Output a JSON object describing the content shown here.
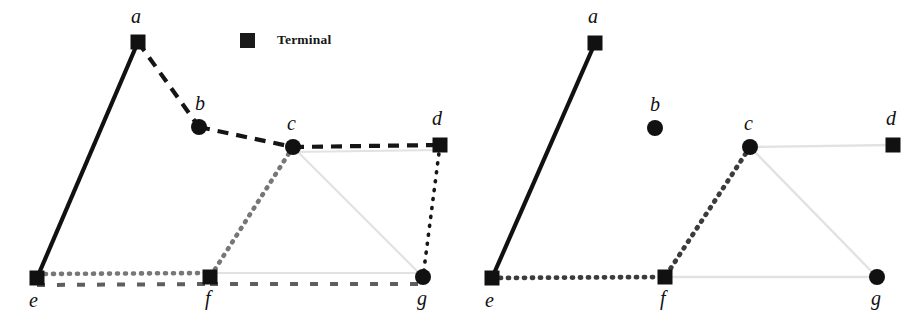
{
  "figure": {
    "width": 924,
    "height": 332,
    "background": "#ffffff"
  },
  "legend": {
    "swatch_icon": "filled-square-marker",
    "swatch_color": "#1a1a1a",
    "label": "Terminal"
  },
  "style": {
    "node_fill": "#111111",
    "square_size": 15,
    "circle_radius": 8,
    "edge_colors": {
      "black": "#111111",
      "dark_gray": "#4a4a4a",
      "mid_gray": "#6f6f6f",
      "light_gray": "#e2e2e2"
    }
  },
  "panels": [
    {
      "id": "left",
      "name": "left-panel",
      "nodes": [
        {
          "id": "a",
          "label": "a",
          "shape": "square",
          "x": 138,
          "y": 42,
          "label_x": 131,
          "label_y": 6,
          "terminal": true
        },
        {
          "id": "b",
          "label": "b",
          "shape": "circle",
          "x": 199,
          "y": 127,
          "label_x": 195,
          "label_y": 93,
          "terminal": false
        },
        {
          "id": "c",
          "label": "c",
          "shape": "circle",
          "x": 293,
          "y": 147,
          "label_x": 287,
          "label_y": 113,
          "terminal": false
        },
        {
          "id": "d",
          "label": "d",
          "shape": "square",
          "x": 440,
          "y": 145,
          "label_x": 432,
          "label_y": 108,
          "terminal": true
        },
        {
          "id": "e",
          "label": "e",
          "shape": "square",
          "x": 37,
          "y": 278,
          "label_x": 29,
          "label_y": 290,
          "terminal": true
        },
        {
          "id": "f",
          "label": "f",
          "shape": "square",
          "x": 210,
          "y": 277,
          "label_x": 205,
          "label_y": 288,
          "terminal": true
        },
        {
          "id": "g",
          "label": "g",
          "shape": "circle",
          "x": 423,
          "y": 277,
          "label_x": 417,
          "label_y": 288,
          "terminal": false
        }
      ],
      "edges": [
        {
          "from": "a",
          "to": "e",
          "style": "solid",
          "color": "#111111",
          "width": 4.2,
          "dash": ""
        },
        {
          "from": "a",
          "to": "b",
          "style": "dashed",
          "color": "#151515",
          "width": 4.2,
          "dash": "11 8"
        },
        {
          "from": "b",
          "to": "c",
          "style": "dashed",
          "color": "#151515",
          "width": 4.2,
          "dash": "11 8"
        },
        {
          "from": "c",
          "to": "d",
          "style": "dashed",
          "color": "#151515",
          "width": 4.2,
          "dash": "11 8"
        },
        {
          "from": "c",
          "to": "d",
          "style": "solid",
          "color": "#e2e2e2",
          "width": 2.2,
          "dash": "",
          "offset_y": 5
        },
        {
          "from": "c",
          "to": "g",
          "style": "solid",
          "color": "#e2e2e2",
          "width": 2.2,
          "dash": ""
        },
        {
          "from": "f",
          "to": "g",
          "style": "solid",
          "color": "#e2e2e2",
          "width": 2.2,
          "dash": "",
          "offset_y": -4
        },
        {
          "from": "c",
          "to": "f",
          "style": "dotted",
          "color": "#777777",
          "width": 4.6,
          "dash": "1 7"
        },
        {
          "from": "e",
          "to": "f",
          "style": "dotted",
          "color": "#777777",
          "width": 4.6,
          "dash": "1 7",
          "offset_y": -4
        },
        {
          "from": "d",
          "to": "g",
          "style": "dotted",
          "color": "#161616",
          "width": 3.6,
          "dash": "1 8"
        },
        {
          "from": "e",
          "to": "f",
          "style": "dashed",
          "color": "#5e5e5e",
          "width": 4.0,
          "dash": "8 12",
          "offset_y": 7
        },
        {
          "from": "f",
          "to": "g",
          "style": "dashed",
          "color": "#5e5e5e",
          "width": 4.0,
          "dash": "8 12",
          "offset_y": 7
        }
      ]
    },
    {
      "id": "right",
      "name": "right-panel",
      "nodes": [
        {
          "id": "a",
          "label": "a",
          "shape": "square",
          "x": 133,
          "y": 43,
          "label_x": 126,
          "label_y": 6,
          "terminal": true
        },
        {
          "id": "b",
          "label": "b",
          "shape": "circle",
          "x": 193,
          "y": 128,
          "label_x": 188,
          "label_y": 94,
          "terminal": false
        },
        {
          "id": "c",
          "label": "c",
          "shape": "circle",
          "x": 288,
          "y": 147,
          "label_x": 282,
          "label_y": 113,
          "terminal": false
        },
        {
          "id": "d",
          "label": "d",
          "shape": "square",
          "x": 431,
          "y": 145,
          "label_x": 424,
          "label_y": 108,
          "terminal": true
        },
        {
          "id": "e",
          "label": "e",
          "shape": "square",
          "x": 30,
          "y": 278,
          "label_x": 23,
          "label_y": 290,
          "terminal": true
        },
        {
          "id": "f",
          "label": "f",
          "shape": "square",
          "x": 203,
          "y": 277,
          "label_x": 198,
          "label_y": 288,
          "terminal": true
        },
        {
          "id": "g",
          "label": "g",
          "shape": "circle",
          "x": 415,
          "y": 277,
          "label_x": 409,
          "label_y": 288,
          "terminal": false
        }
      ],
      "edges": [
        {
          "from": "a",
          "to": "e",
          "style": "solid",
          "color": "#111111",
          "width": 4.2,
          "dash": ""
        },
        {
          "from": "c",
          "to": "d",
          "style": "solid",
          "color": "#e2e2e2",
          "width": 2.4,
          "dash": ""
        },
        {
          "from": "c",
          "to": "g",
          "style": "solid",
          "color": "#e2e2e2",
          "width": 2.4,
          "dash": ""
        },
        {
          "from": "f",
          "to": "g",
          "style": "solid",
          "color": "#e2e2e2",
          "width": 2.4,
          "dash": ""
        },
        {
          "from": "c",
          "to": "f",
          "style": "dotted",
          "color": "#3c3c3c",
          "width": 4.8,
          "dash": "1 7"
        },
        {
          "from": "e",
          "to": "f",
          "style": "dotted",
          "color": "#3c3c3c",
          "width": 4.8,
          "dash": "1 7"
        }
      ]
    }
  ]
}
